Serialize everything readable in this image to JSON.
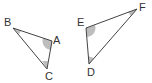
{
  "diagram": {
    "triangles": [
      {
        "name": "ABC",
        "vertices": {
          "A": [
            52,
            41
          ],
          "B": [
            13,
            28
          ],
          "C": [
            47,
            69
          ]
        },
        "shaded_angles": [
          "A",
          "B",
          "C"
        ]
      },
      {
        "name": "DEF",
        "vertices": {
          "D": [
            89,
            64
          ],
          "E": [
            86,
            28
          ],
          "F": [
            137,
            9
          ]
        },
        "shaded_angles": [
          "D",
          "E",
          "F"
        ]
      }
    ],
    "labels": {
      "A": "A",
      "B": "B",
      "C": "C",
      "D": "D",
      "E": "E",
      "F": "F"
    },
    "colors": {
      "line": "#444444",
      "shade": "#bbbbbb"
    }
  }
}
